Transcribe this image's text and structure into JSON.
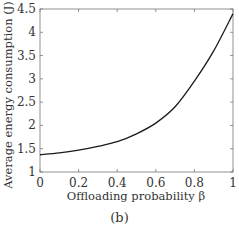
{
  "chart_data": {
    "type": "line",
    "title": "",
    "xlabel": "Offloading probability β",
    "ylabel": "Average energy consumption (J)",
    "xlim": [
      0,
      1
    ],
    "ylim": [
      1,
      4.5
    ],
    "xticks": [
      "0",
      "0.2",
      "0.4",
      "0.6",
      "0.8",
      "1"
    ],
    "yticks": [
      "1",
      "1.5",
      "2",
      "2.5",
      "3",
      "3.5",
      "4",
      "4.5"
    ],
    "grid": false,
    "legend": null,
    "series": [
      {
        "name": "energy",
        "color": "#1a1a1a",
        "x": [
          0,
          0.1,
          0.2,
          0.3,
          0.4,
          0.5,
          0.6,
          0.7,
          0.8,
          0.9,
          1.0
        ],
        "y": [
          1.37,
          1.41,
          1.47,
          1.55,
          1.65,
          1.82,
          2.05,
          2.4,
          2.95,
          3.6,
          4.4
        ]
      }
    ]
  },
  "caption": "(b)"
}
